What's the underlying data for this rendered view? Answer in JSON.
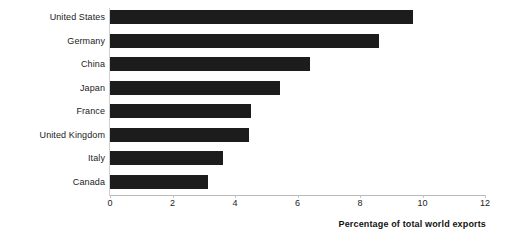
{
  "chart_data": {
    "type": "bar",
    "orientation": "horizontal",
    "title": "",
    "subtitle": "",
    "xlabel": "Percentage of total world exports",
    "ylabel": "",
    "categories": [
      "United States",
      "Germany",
      "China",
      "Japan",
      "France",
      "United Kingdom",
      "Italy",
      "Canada"
    ],
    "values": [
      9.7,
      8.6,
      6.4,
      5.45,
      4.5,
      4.45,
      3.6,
      3.15
    ],
    "xlim": [
      0,
      12
    ],
    "xticks": [
      0,
      2,
      4,
      6,
      8,
      10,
      12
    ],
    "xtick_labels": [
      "0",
      "2",
      "4",
      "6",
      "8",
      "10",
      "12"
    ],
    "grid": false,
    "legend": null,
    "bar_color": "#1c1c1c",
    "background_color": "#ffffff",
    "axis_color": "#b9b9b9",
    "text_color": "#1b1b1b"
  }
}
